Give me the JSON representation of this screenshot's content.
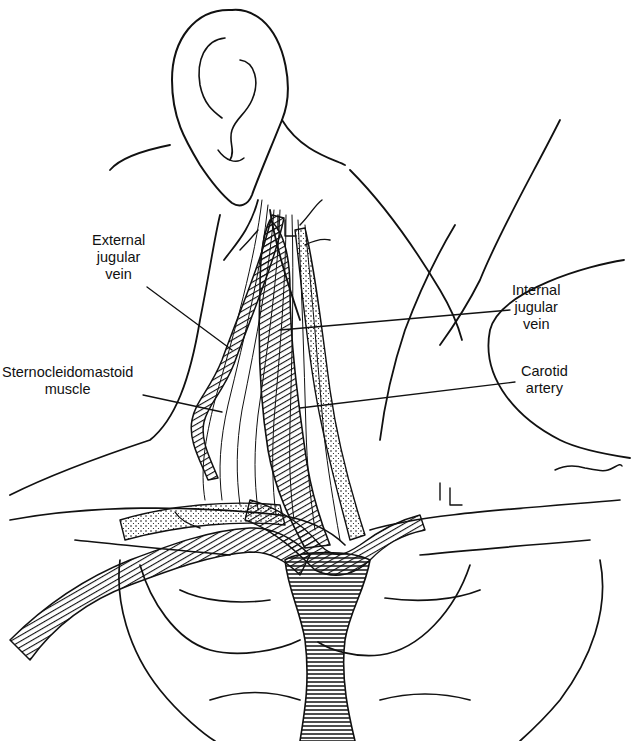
{
  "figure": {
    "labels": {
      "external_jugular_vein": [
        "External",
        "jugular",
        "vein"
      ],
      "sternocleidomastoid_muscle": [
        "Sternocleidomastoid",
        "muscle"
      ],
      "internal_jugular_vein": [
        "Internal",
        "jugular",
        "vein"
      ],
      "carotid_artery": [
        "Carotid",
        "artery"
      ]
    },
    "markings": {
      "vl_upper": "VL",
      "vl_lower": "VL",
      "signature": "BMTer"
    },
    "colors": {
      "ink": "#111111",
      "background": "#ffffff"
    }
  }
}
